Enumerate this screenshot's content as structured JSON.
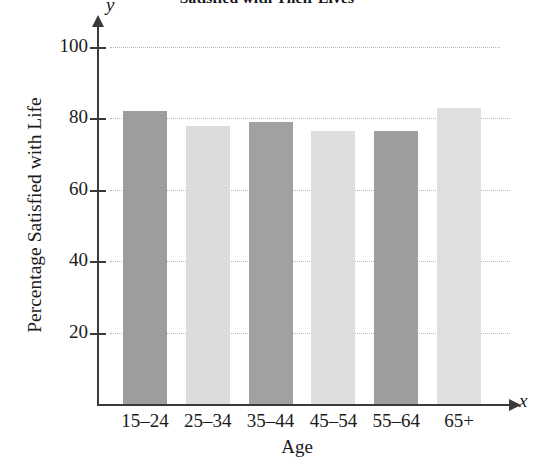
{
  "chart_data": {
    "type": "bar",
    "title": "Satisfied with Their Lives",
    "xlabel": "Age",
    "ylabel": "Percentage Satisfied with Life",
    "categories": [
      "15–24",
      "25–34",
      "35–44",
      "45–54",
      "55–64",
      "65+"
    ],
    "values": [
      82,
      78,
      79,
      76.5,
      76.5,
      83
    ],
    "ylim": [
      0,
      100
    ],
    "yticks": [
      20,
      40,
      60,
      80,
      100
    ],
    "ytick_labels": [
      "20",
      "40",
      "60",
      "80",
      "100"
    ],
    "grid": true,
    "grid_axis": "y",
    "legend": null,
    "bar_colors": [
      "#9d9d9d",
      "#dcdcdc",
      "#a1a1a1",
      "#dedede",
      "#9e9e9e",
      "#dfdfdf"
    ],
    "axis_letters": {
      "x": "x",
      "y": "y"
    }
  },
  "axes": {
    "x_letter": "x",
    "y_letter": "y"
  }
}
